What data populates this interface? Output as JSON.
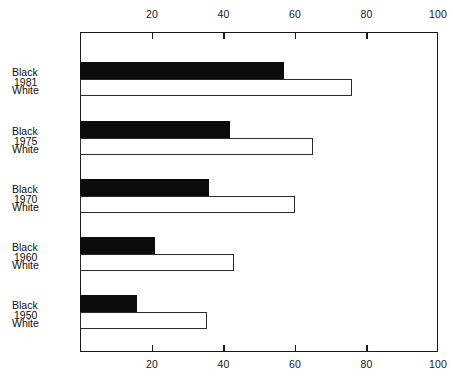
{
  "chart_data": {
    "type": "bar",
    "orientation": "horizontal",
    "title": "",
    "subtitle": "",
    "xlabel": "",
    "ylabel": "",
    "xlim": [
      0,
      100
    ],
    "xticks": [
      20,
      40,
      60,
      80,
      100
    ],
    "xtick_labels": [
      "20",
      "40",
      "60",
      "80",
      "100"
    ],
    "grid": false,
    "legend": "none",
    "axis_positions": [
      "top",
      "bottom"
    ],
    "categories": [
      "1981",
      "1975",
      "1970",
      "1960",
      "1950"
    ],
    "series": [
      {
        "name": "Black",
        "style": "filled",
        "color": "#0b0b0b",
        "values": [
          57,
          42,
          36,
          21,
          16
        ]
      },
      {
        "name": "White",
        "style": "outlined",
        "color": "#ffffff",
        "edge_color": "#2b2b2b",
        "values": [
          76,
          65,
          60,
          43,
          35.5
        ]
      }
    ]
  },
  "labels": {
    "groups": [
      {
        "year": "1981",
        "black": "Black",
        "white": "White"
      },
      {
        "year": "1975",
        "black": "Black",
        "white": "White"
      },
      {
        "year": "1970",
        "black": "Black",
        "white": "White"
      },
      {
        "year": "1960",
        "black": "Black",
        "white": "White"
      },
      {
        "year": "1950",
        "black": "Black",
        "white": "White"
      }
    ]
  },
  "axis": {
    "top_ticks": [
      "20",
      "40",
      "60",
      "80",
      "100"
    ],
    "bottom_ticks": [
      "20",
      "40",
      "60",
      "80",
      "100"
    ]
  }
}
